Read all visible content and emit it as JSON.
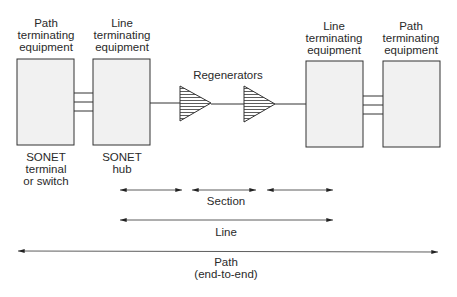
{
  "diagram": {
    "equipment": [
      {
        "id": "pte-left",
        "title_lines": [
          "Path",
          "terminating",
          "equipment"
        ],
        "caption_lines": [
          "SONET",
          "terminal",
          "or switch"
        ]
      },
      {
        "id": "lte-left",
        "title_lines": [
          "Line",
          "terminating",
          "equipment"
        ],
        "caption_lines": [
          "SONET",
          "hub"
        ]
      },
      {
        "id": "lte-right",
        "title_lines": [
          "Line",
          "terminating",
          "equipment"
        ],
        "caption_lines": []
      },
      {
        "id": "pte-right",
        "title_lines": [
          "Path",
          "terminating",
          "equipment"
        ],
        "caption_lines": []
      }
    ],
    "regenerators_label": "Regenerators",
    "spans": {
      "section": "Section",
      "line": "Line",
      "path_lines": [
        "Path",
        "(end-to-end)"
      ]
    },
    "colors": {
      "box_fill": "#f1f1f1",
      "stroke": "#333333",
      "text": "#2a2a2a"
    }
  }
}
